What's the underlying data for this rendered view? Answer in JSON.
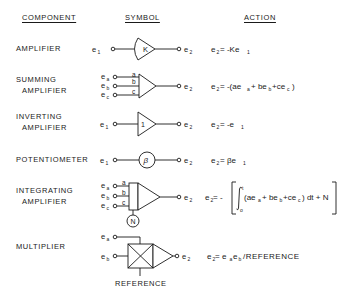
{
  "headers": {
    "component": "COMPONENT",
    "symbol": "SYMBOL",
    "action": "ACTION"
  },
  "rows": [
    {
      "id": "amplifier",
      "label_lines": [
        "AMPLIFIER"
      ],
      "symbol": {
        "type": "amplifier",
        "gain_label": "K",
        "inputs": [
          "e1"
        ],
        "output": "e2"
      },
      "action": "e₂ = -Ke₁"
    },
    {
      "id": "summing-amplifier",
      "label_lines": [
        "SUMMING",
        "AMPLIFIER"
      ],
      "symbol": {
        "type": "summing-amplifier",
        "input_gain_labels": [
          "a",
          "b",
          "c"
        ],
        "inputs": [
          "ea",
          "eb",
          "ec"
        ],
        "output": "e2"
      },
      "action": "e₂ = -(ae_a + be_b + ce_c)"
    },
    {
      "id": "inverting-amplifier",
      "label_lines": [
        "INVERTING",
        "AMPLIFIER"
      ],
      "symbol": {
        "type": "inverting-amplifier",
        "gain_label": "1",
        "inputs": [
          "e1"
        ],
        "output": "e2"
      },
      "action": "e₂ = -e₁"
    },
    {
      "id": "potentiometer",
      "label_lines": [
        "POTENTIOMETER"
      ],
      "symbol": {
        "type": "potentiometer",
        "coefficient_label": "β",
        "inputs": [
          "e1"
        ],
        "output": "e2"
      },
      "action": "e₂ = βe₁"
    },
    {
      "id": "integrating-amplifier",
      "label_lines": [
        "INTEGRATING",
        "AMPLIFIER"
      ],
      "symbol": {
        "type": "integrating-amplifier",
        "input_gain_labels": [
          "a",
          "b",
          "c"
        ],
        "initial_condition_label": "N",
        "inputs": [
          "ea",
          "eb",
          "ec"
        ],
        "output": "e2"
      },
      "action": "e₂ = -[∫₀ᵗ (ae_a + be_b + ce_c) dt + N]"
    },
    {
      "id": "multiplier",
      "label_lines": [
        "MULTIPLIER"
      ],
      "symbol": {
        "type": "multiplier",
        "inputs": [
          "ea",
          "eb"
        ],
        "output": "e2",
        "reference_label": "REFERENCE"
      },
      "action": "e₂ = e_a e_b / REFERENCE"
    }
  ],
  "text": {
    "amp_label": "AMPLIFIER",
    "summing_1": "SUMMING",
    "summing_2": "AMPLIFIER",
    "inverting_1": "INVERTING",
    "inverting_2": "AMPLIFIER",
    "pot_label": "POTENTIOMETER",
    "integrating_1": "INTEGRATING",
    "integrating_2": "AMPLIFIER",
    "mult_label": "MULTIPLIER",
    "gain_K": "K",
    "gain_1": "1",
    "beta": "β",
    "N": "N",
    "a": "a",
    "b": "b",
    "c": "c",
    "reference": "REFERENCE",
    "e": "e",
    "sub_1": "1",
    "sub_2": "2",
    "sub_a": "a",
    "sub_b": "b",
    "sub_c": "c",
    "eq_amp_rhs": " = -Ke",
    "eq_inv_rhs": " = -e",
    "eq_pot_rhs": " = βe",
    "eq_sum_1": " = -(ae",
    "eq_sum_2": "+ be",
    "eq_sum_3": "+ce",
    "eq_sum_4": ")",
    "eq_int_1": " = -",
    "eq_int_2": "(ae",
    "eq_int_3": "+ be",
    "eq_int_4": "+ce",
    "eq_int_5": ") dt + N",
    "eq_int_lower": "o",
    "eq_int_upper": "t",
    "eq_mult_1": " = e",
    "eq_mult_3": "e",
    "eq_mult_4": "/REFERENCE"
  }
}
